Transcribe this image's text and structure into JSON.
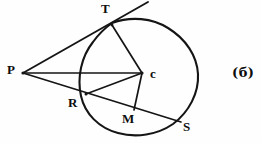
{
  "figure": {
    "caption": "(б)",
    "background_color": "#fefefe",
    "ink_color": "#151515",
    "width": 261,
    "height": 143
  },
  "labels": {
    "P": "P",
    "T": "T",
    "C": "c",
    "R": "R",
    "M": "M",
    "S": "S"
  },
  "geometry": {
    "circle": {
      "cx": 140,
      "cy": 74,
      "r": 58
    },
    "points": {
      "P": {
        "x": 23,
        "y": 73
      },
      "T": {
        "x": 111,
        "y": 25
      },
      "C": {
        "x": 142,
        "y": 73
      },
      "R": {
        "x": 86,
        "y": 94
      },
      "M": {
        "x": 134,
        "y": 110
      },
      "S": {
        "x": 180,
        "y": 122
      }
    },
    "segments": [
      {
        "name": "tangent-line-PT-extended",
        "from": "P",
        "to": "tangent-end"
      },
      {
        "name": "radius-CT",
        "from": "C",
        "to": "T"
      },
      {
        "name": "secant-PC",
        "from": "P",
        "to": "C"
      },
      {
        "name": "secant-PRS",
        "from": "P",
        "to": "S"
      },
      {
        "name": "chord-RC",
        "from": "R",
        "to": "C"
      },
      {
        "name": "radius-CM",
        "from": "C",
        "to": "M"
      }
    ]
  }
}
